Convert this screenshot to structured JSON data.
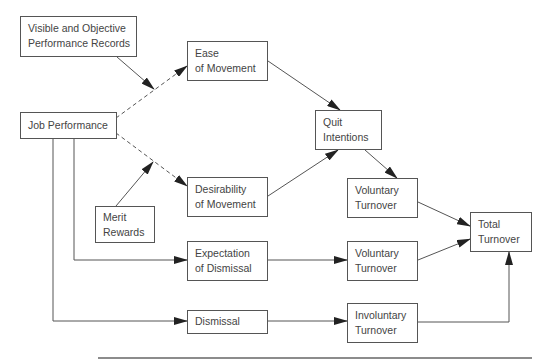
{
  "diagram": {
    "nodes": [
      {
        "id": "visible",
        "lines": [
          "Visible and Objective",
          "Performance Records"
        ],
        "x": 20,
        "y": 16,
        "w": 117,
        "h": 41
      },
      {
        "id": "ease",
        "lines": [
          "Ease",
          "of Movement"
        ],
        "x": 187,
        "y": 41,
        "w": 81,
        "h": 40
      },
      {
        "id": "job",
        "lines": [
          "Job Performance"
        ],
        "x": 20,
        "y": 112,
        "w": 97,
        "h": 27
      },
      {
        "id": "quit",
        "lines": [
          "Quit",
          "Intentions"
        ],
        "x": 315,
        "y": 110,
        "w": 67,
        "h": 40
      },
      {
        "id": "merit",
        "lines": [
          "Merit",
          "Rewards"
        ],
        "x": 95,
        "y": 206,
        "w": 60,
        "h": 37
      },
      {
        "id": "desirability",
        "lines": [
          "Desirability",
          "of Movement"
        ],
        "x": 187,
        "y": 177,
        "w": 81,
        "h": 40
      },
      {
        "id": "voluntary1",
        "lines": [
          "Voluntary",
          "Turnover"
        ],
        "x": 347,
        "y": 178,
        "w": 71,
        "h": 40
      },
      {
        "id": "total",
        "lines": [
          "Total",
          "Turnover"
        ],
        "x": 470,
        "y": 212,
        "w": 62,
        "h": 40
      },
      {
        "id": "expectation",
        "lines": [
          "Expectation",
          "of Dismissal"
        ],
        "x": 187,
        "y": 241,
        "w": 81,
        "h": 40
      },
      {
        "id": "voluntary2",
        "lines": [
          "Voluntary",
          "Turnover"
        ],
        "x": 347,
        "y": 241,
        "w": 71,
        "h": 40
      },
      {
        "id": "dismissal",
        "lines": [
          "Dismissal"
        ],
        "x": 187,
        "y": 310,
        "w": 81,
        "h": 24
      },
      {
        "id": "involuntary",
        "lines": [
          "Involuntary",
          "Turnover"
        ],
        "x": 347,
        "y": 303,
        "w": 71,
        "h": 40
      }
    ],
    "edges": [
      {
        "from": "visible",
        "to": "job-ease-link",
        "style": "solid"
      },
      {
        "from": "job",
        "to": "ease",
        "style": "dashed"
      },
      {
        "from": "job",
        "to": "desirability",
        "style": "dashed"
      },
      {
        "from": "merit",
        "to": "job-desirability-link",
        "style": "solid"
      },
      {
        "from": "ease",
        "to": "quit",
        "style": "solid"
      },
      {
        "from": "desirability",
        "to": "quit",
        "style": "solid"
      },
      {
        "from": "quit",
        "to": "voluntary1",
        "style": "solid"
      },
      {
        "from": "voluntary1",
        "to": "total",
        "style": "solid"
      },
      {
        "from": "job",
        "to": "expectation",
        "style": "solid"
      },
      {
        "from": "expectation",
        "to": "voluntary2",
        "style": "solid"
      },
      {
        "from": "voluntary2",
        "to": "total",
        "style": "solid"
      },
      {
        "from": "job",
        "to": "dismissal",
        "style": "solid"
      },
      {
        "from": "dismissal",
        "to": "involuntary",
        "style": "solid"
      },
      {
        "from": "involuntary",
        "to": "total",
        "style": "solid"
      }
    ],
    "colors": {
      "line": "#555555",
      "text": "#444444",
      "background": "#ffffff"
    }
  }
}
